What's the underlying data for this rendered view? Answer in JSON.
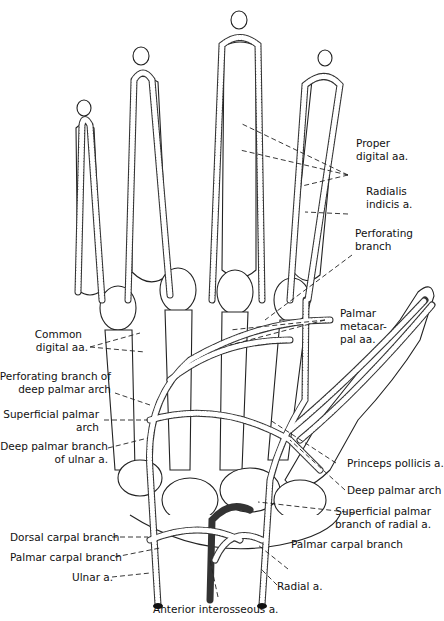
{
  "figure": {
    "labels": {
      "proper_digital": [
        "Proper",
        "digital aa."
      ],
      "radialis_indicis": [
        "Radialis",
        "indicis a."
      ],
      "perforating_branch": [
        "Perforating",
        "branch"
      ],
      "palmar_metacarpal": [
        "Palmar",
        "metacar-",
        "pal aa."
      ],
      "common_digital": [
        "Common",
        "digital aa."
      ],
      "perforating_deep_arch": [
        "Perforating branch of",
        "deep palmar arch"
      ],
      "superficial_palmar_arch": [
        "Superficial palmar",
        "arch"
      ],
      "deep_palmar_ulnar": [
        "Deep palmar branch",
        "of ulnar a."
      ],
      "princeps_pollicis": "Princeps pollicis a.",
      "deep_palmar_arch": "Deep palmar arch",
      "superficial_palmar_radial": [
        "Superficial palmar",
        "branch of radial a."
      ],
      "dorsal_carpal": "Dorsal carpal branch",
      "palmar_carpal_left": "Palmar carpal branch",
      "palmar_carpal_right": "Palmar carpal branch",
      "ulnar": "Ulnar a.",
      "radial": "Radial a.",
      "anterior_interosseous": "Anterior interosseous a."
    },
    "colors": {
      "ink": "#111111",
      "background": "#ffffff"
    }
  }
}
